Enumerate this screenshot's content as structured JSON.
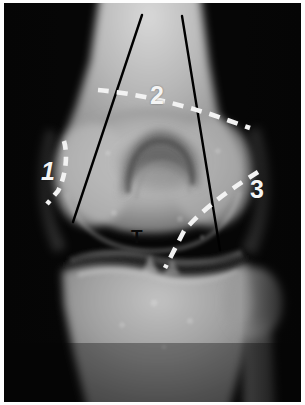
{
  "figure": {
    "kind": "radiograph",
    "modality": "x-ray",
    "view": "knee-tunnel-notch-view",
    "width": 305,
    "height": 405,
    "border_color": "#ffffff",
    "background_color": "#050505"
  },
  "annotations": {
    "labels": [
      {
        "id": "1",
        "text": "1",
        "color": "#f4f4f4",
        "x": 37,
        "y": 156
      },
      {
        "id": "2",
        "text": "2",
        "color": "#f4f4f4",
        "x": 146,
        "y": 80
      },
      {
        "id": "3",
        "text": "3",
        "color": "#f4f4f4",
        "x": 246,
        "y": 174
      },
      {
        "id": "T",
        "text": "T",
        "color": "#0a0a0a",
        "x": 127,
        "y": 224
      }
    ],
    "solid_lines": [
      {
        "id": "left-black-line",
        "color": "#000000",
        "x1": 142,
        "y1": 15,
        "x2": 73,
        "y2": 222
      },
      {
        "id": "right-black-line",
        "color": "#000000",
        "x1": 182,
        "y1": 16,
        "x2": 220,
        "y2": 250
      }
    ],
    "dashed_lines": [
      {
        "id": "dashed-line-1",
        "color": "#f2f2f2",
        "points": "63,141 66,156 63,174 55,190 47,203"
      },
      {
        "id": "dashed-line-2",
        "color": "#f2f2f2",
        "points": "98,90 140,95 176,104 210,114 250,128"
      },
      {
        "id": "dashed-line-3",
        "color": "#f2f2f2",
        "points": "258,172 232,186 210,199 190,216 172,240 165,268"
      }
    ]
  }
}
